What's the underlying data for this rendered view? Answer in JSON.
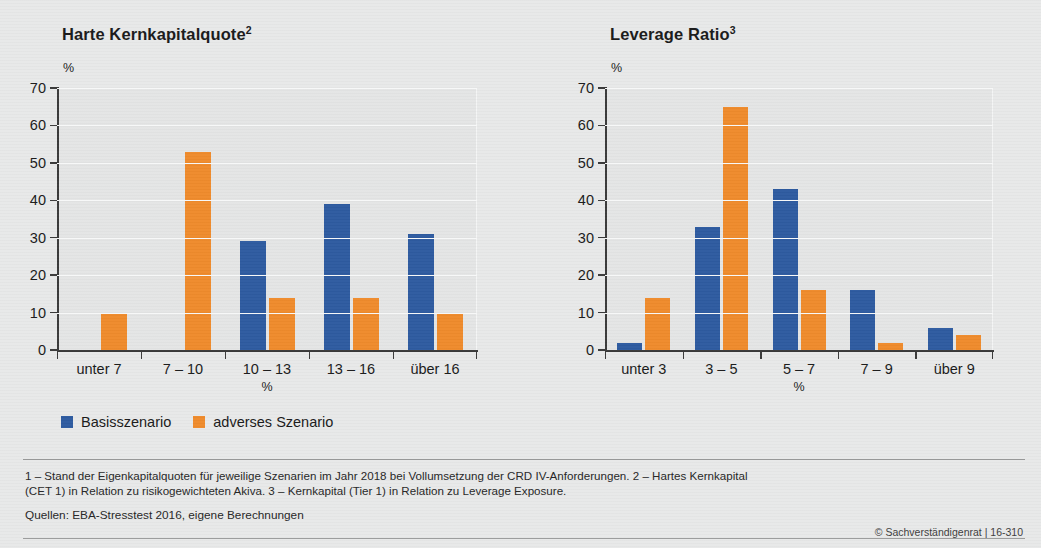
{
  "figure": {
    "legend": [
      {
        "key": "base",
        "label": "Basisszenario",
        "color": "#2e5ba0"
      },
      {
        "key": "adverse",
        "label": "adverses Szenario",
        "color": "#ef8b2c"
      }
    ],
    "footnote_line1": "1 – Stand der Eigenkapitalquoten für jeweilige Szenarien im Jahr 2018 bei Vollumsetzung der CRD IV-Anforderungen.  2 – Hartes Kernkapital",
    "footnote_line2": "(CET 1) in Relation zu risikogewichteten Akiva.  3 – Kernkapital (Tier 1) in Relation zu Leverage Exposure.",
    "sources": "Quellen: EBA-Stresstest 2016, eigene Berechnungen",
    "copyright": "© Sachverständigenrat | 16-310"
  },
  "chart_data": [
    {
      "type": "bar",
      "title": "Harte Kernkapitalquote",
      "title_superscript": "2",
      "unit_top": "%",
      "xlabel": "%",
      "ylabel": "%",
      "ylim": [
        0,
        70
      ],
      "yticks": [
        0,
        10,
        20,
        30,
        40,
        50,
        60,
        70
      ],
      "ytick_labels": [
        "0",
        "10",
        "20",
        "30",
        "40",
        "50",
        "60",
        "70"
      ],
      "grid": true,
      "legend_position": "below",
      "categories": [
        "unter 7",
        "7 – 10",
        "10 – 13",
        "13 – 16",
        "über 16"
      ],
      "series": [
        {
          "name": "Basisszenario",
          "color": "#2e5ba0",
          "values": [
            0,
            0,
            29,
            39,
            31
          ]
        },
        {
          "name": "adverses Szenario",
          "color": "#ef8b2c",
          "values": [
            10,
            53,
            14,
            14,
            10
          ]
        }
      ]
    },
    {
      "type": "bar",
      "title": "Leverage Ratio",
      "title_superscript": "3",
      "unit_top": "%",
      "xlabel": "%",
      "ylabel": "%",
      "ylim": [
        0,
        70
      ],
      "yticks": [
        0,
        10,
        20,
        30,
        40,
        50,
        60,
        70
      ],
      "ytick_labels": [
        "0",
        "10",
        "20",
        "30",
        "40",
        "50",
        "60",
        "70"
      ],
      "grid": true,
      "legend_position": "below",
      "categories": [
        "unter 3",
        "3 – 5",
        "5 – 7",
        "7 – 9",
        "über 9"
      ],
      "series": [
        {
          "name": "Basisszenario",
          "color": "#2e5ba0",
          "values": [
            2,
            33,
            43,
            16,
            6
          ]
        },
        {
          "name": "adverses Szenario",
          "color": "#ef8b2c",
          "values": [
            14,
            65,
            16,
            2,
            4
          ]
        }
      ]
    }
  ]
}
